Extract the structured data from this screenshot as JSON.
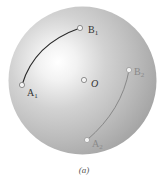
{
  "figure": {
    "caption": "(a)",
    "sphere": {
      "cx": 82.5,
      "cy": 80.5,
      "r": 74,
      "highlight_center": [
        58,
        62
      ],
      "colors": {
        "highlight": "#ffffff",
        "mid": "#d4d4d4",
        "edge": "#a6a6a6"
      }
    },
    "points": [
      {
        "id": "A1",
        "label": "A",
        "subscript": "1",
        "x": 22,
        "y": 85,
        "label_x": 27,
        "label_y": 96,
        "color": "#333333"
      },
      {
        "id": "B1",
        "label": "B",
        "subscript": "1",
        "x": 80,
        "y": 28,
        "label_x": 88,
        "label_y": 33,
        "color": "#333333"
      },
      {
        "id": "O",
        "label": "O",
        "subscript": "",
        "x": 84,
        "y": 80,
        "label_x": 91,
        "label_y": 87,
        "color": "#333333"
      },
      {
        "id": "B2",
        "label": "B",
        "subscript": "2",
        "x": 129,
        "y": 70,
        "label_x": 134,
        "label_y": 75,
        "color": "#8a8a8a"
      },
      {
        "id": "A2",
        "label": "A",
        "subscript": "2",
        "x": 87,
        "y": 140,
        "label_x": 92,
        "label_y": 147,
        "color": "#8a8a8a"
      }
    ],
    "arcs": [
      {
        "from": "A1",
        "to": "B1",
        "color": "#2a2a2a",
        "width": 1.1,
        "control": [
          34,
          44
        ]
      },
      {
        "from": "A2",
        "to": "B2",
        "color": "#7a7a7a",
        "width": 0.8,
        "control": [
          122,
          110
        ]
      }
    ]
  }
}
